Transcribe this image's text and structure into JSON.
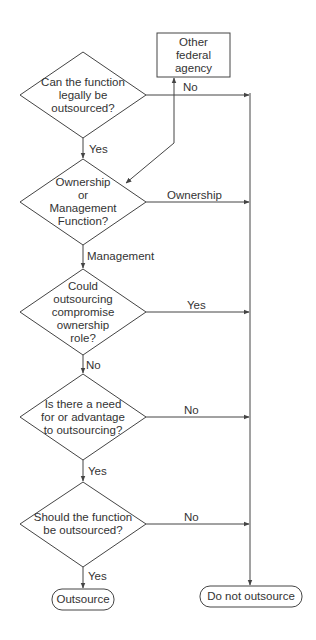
{
  "nodes": {
    "d1": {
      "label": "Can the function legally be outsourced?",
      "lines": [
        "Can the function",
        "legally be",
        "outsourced?"
      ]
    },
    "d2": {
      "label": "Ownership or Management Function?",
      "lines": [
        "Ownership",
        "or",
        "Management",
        "Function?"
      ]
    },
    "d3": {
      "label": "Could outsourcing compromise ownership role?",
      "lines": [
        "Could",
        "outsourcing",
        "compromise",
        "ownership",
        "role?"
      ]
    },
    "d4": {
      "label": "Is there a need for or advantage to outsourcing?",
      "lines": [
        "Is there a need",
        "for or advantage",
        "to outsourcing?"
      ]
    },
    "d5": {
      "label": "Should the function be outsourced?",
      "lines": [
        "Should the function",
        "be outsourced?"
      ]
    },
    "other_agency": {
      "label": "Other federal agency",
      "lines": [
        "Other",
        "federal",
        "agency"
      ]
    },
    "outsource": {
      "label": "Outsource"
    },
    "do_not_outsource": {
      "label": "Do not outsource"
    }
  },
  "edges": {
    "d1_no": "No",
    "d1_yes": "Yes",
    "d2_ownership": "Ownership",
    "d2_management": "Management",
    "d3_yes": "Yes",
    "d3_no": "No",
    "d4_no": "No",
    "d4_yes": "Yes",
    "d5_no": "No",
    "d5_yes": "Yes"
  },
  "colors": {
    "line": "#444444",
    "text": "#333333",
    "background": "#ffffff"
  }
}
